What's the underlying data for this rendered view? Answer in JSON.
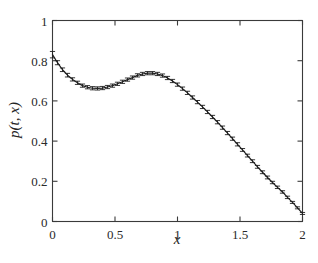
{
  "figure": {
    "background_color": "#ffffff",
    "axis_color": "#3a3a3a",
    "curve_color": "#1f1f1f",
    "errorbar_color": "#1f1f1f"
  },
  "chart_data": {
    "type": "line",
    "title": "",
    "subtitle": "",
    "xlabel": "x",
    "ylabel": "p(t, x)",
    "xlim": [
      0,
      2
    ],
    "ylim": [
      0,
      1
    ],
    "grid": false,
    "legend": null,
    "legend_position": "none",
    "xticks": [
      0,
      0.5,
      1,
      1.5,
      2
    ],
    "xtick_labels": [
      "0",
      "0.5",
      "1",
      "1.5",
      "2"
    ],
    "yticks": [
      0,
      0.2,
      0.4,
      0.6,
      0.8,
      1
    ],
    "ytick_labels": [
      "0",
      "0.2",
      "0.4",
      "0.6",
      "0.8",
      "1"
    ],
    "annotations": [],
    "series": [
      {
        "name": "p(t, x)",
        "style": "line-with-errorbars",
        "marker": "errorbar-cap",
        "x": [
          0.0,
          0.04,
          0.08,
          0.12,
          0.16,
          0.2,
          0.24,
          0.28,
          0.32,
          0.36,
          0.4,
          0.44,
          0.48,
          0.52,
          0.56,
          0.6,
          0.64,
          0.68,
          0.72,
          0.76,
          0.8,
          0.84,
          0.88,
          0.92,
          0.96,
          1.0,
          1.04,
          1.08,
          1.12,
          1.16,
          1.2,
          1.24,
          1.28,
          1.32,
          1.36,
          1.4,
          1.44,
          1.48,
          1.52,
          1.56,
          1.6,
          1.64,
          1.68,
          1.72,
          1.76,
          1.8,
          1.84,
          1.88,
          1.92,
          1.96,
          2.0
        ],
        "y": [
          0.83,
          0.79,
          0.755,
          0.728,
          0.707,
          0.69,
          0.676,
          0.668,
          0.663,
          0.662,
          0.664,
          0.669,
          0.676,
          0.685,
          0.695,
          0.706,
          0.716,
          0.727,
          0.734,
          0.738,
          0.738,
          0.734,
          0.726,
          0.714,
          0.699,
          0.681,
          0.661,
          0.64,
          0.617,
          0.594,
          0.57,
          0.545,
          0.52,
          0.494,
          0.467,
          0.44,
          0.412,
          0.384,
          0.356,
          0.328,
          0.3,
          0.272,
          0.245,
          0.219,
          0.194,
          0.17,
          0.147,
          0.12,
          0.095,
          0.068,
          0.04
        ],
        "yerr": [
          0.016,
          0.01,
          0.009,
          0.009,
          0.008,
          0.008,
          0.008,
          0.008,
          0.008,
          0.008,
          0.008,
          0.008,
          0.008,
          0.008,
          0.008,
          0.008,
          0.008,
          0.008,
          0.008,
          0.008,
          0.008,
          0.008,
          0.008,
          0.008,
          0.008,
          0.008,
          0.008,
          0.008,
          0.008,
          0.008,
          0.008,
          0.008,
          0.008,
          0.008,
          0.008,
          0.008,
          0.008,
          0.008,
          0.007,
          0.007,
          0.007,
          0.007,
          0.007,
          0.007,
          0.006,
          0.006,
          0.006,
          0.006,
          0.005,
          0.005,
          0.005
        ]
      }
    ]
  }
}
